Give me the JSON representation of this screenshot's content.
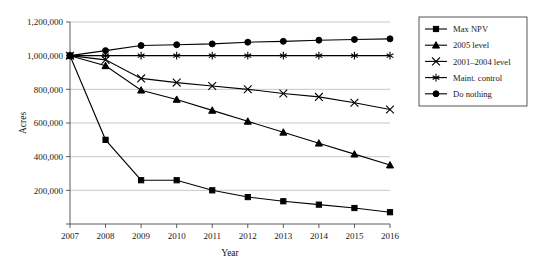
{
  "chart_data": {
    "type": "line",
    "title": "",
    "xlabel": "Year",
    "ylabel": "Acres",
    "x": [
      2007,
      2008,
      2009,
      2010,
      2011,
      2012,
      2013,
      2014,
      2015,
      2016
    ],
    "xtick_labels": [
      "2007",
      "2008",
      "2009",
      "2010",
      "2011",
      "2012",
      "2013",
      "2014",
      "2015",
      "2016"
    ],
    "ytick_labels": [
      "",
      "200,000",
      "400,000",
      "600,000",
      "800,000",
      "1,000,000",
      "1,200,000"
    ],
    "ytick_values": [
      0,
      200000,
      400000,
      600000,
      800000,
      1000000,
      1200000
    ],
    "ylim": [
      0,
      1200000
    ],
    "xlim": [
      2007,
      2016
    ],
    "grid": true,
    "legend_position": "right",
    "series": [
      {
        "name": "Max NPV",
        "marker": "square",
        "values": [
          1000000,
          500000,
          260000,
          260000,
          200000,
          160000,
          135000,
          115000,
          95000,
          70000
        ]
      },
      {
        "name": "2005 level",
        "marker": "triangle",
        "values": [
          1000000,
          940000,
          795000,
          740000,
          675000,
          610000,
          545000,
          480000,
          415000,
          350000
        ]
      },
      {
        "name": "2001–2004 level",
        "marker": "x-cross",
        "values": [
          1000000,
          975000,
          865000,
          840000,
          820000,
          800000,
          775000,
          755000,
          720000,
          680000
        ]
      },
      {
        "name": "Maint. control",
        "marker": "asterisk",
        "values": [
          1000000,
          1000000,
          1000000,
          1000000,
          1000000,
          1000000,
          1000000,
          1000000,
          1000000,
          1000000
        ]
      },
      {
        "name": "Do nothing",
        "marker": "circle",
        "values": [
          1000000,
          1030000,
          1060000,
          1065000,
          1070000,
          1080000,
          1085000,
          1092000,
          1096000,
          1100000
        ]
      }
    ]
  }
}
